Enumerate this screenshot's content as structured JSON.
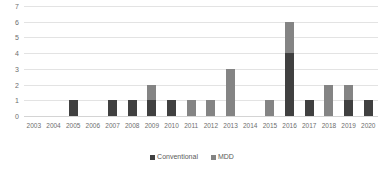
{
  "chart_data": {
    "type": "bar",
    "stacked": true,
    "title": "",
    "subtitle": "",
    "xlabel": "",
    "ylabel": "",
    "ylim": [
      0,
      7
    ],
    "ytick_step": 1,
    "yticks": [
      7,
      6,
      5,
      4,
      3,
      2,
      1,
      0
    ],
    "grid": true,
    "legend_position": "bottom",
    "categories": [
      "2003",
      "2004",
      "2005",
      "2006",
      "2007",
      "2008",
      "2009",
      "2010",
      "2011",
      "2012",
      "2013",
      "2014",
      "2015",
      "2016",
      "2017",
      "2018",
      "2019",
      "2020"
    ],
    "series": [
      {
        "name": "Conventional",
        "color": "#404040",
        "values": [
          0,
          0,
          1,
          0,
          1,
          1,
          1,
          1,
          0,
          0,
          0,
          0,
          0,
          4,
          1,
          0,
          1,
          1
        ]
      },
      {
        "name": "MDD",
        "color": "#848484",
        "values": [
          0,
          0,
          0,
          0,
          0,
          0,
          1,
          0,
          1,
          1,
          3,
          0,
          1,
          2,
          0,
          2,
          1,
          0
        ]
      }
    ],
    "totals": [
      0,
      0,
      1,
      0,
      1,
      1,
      2,
      1,
      1,
      1,
      3,
      0,
      1,
      6,
      1,
      2,
      2,
      1
    ]
  },
  "legend": {
    "items": [
      {
        "label": "Conventional",
        "color": "#404040"
      },
      {
        "label": "MDD",
        "color": "#848484"
      }
    ]
  },
  "colors": {
    "conventional": "#404040",
    "mdd": "#848484",
    "gridline": "#e3e3e3",
    "axis_text": "#6e6e6e",
    "background": "#ffffff"
  }
}
